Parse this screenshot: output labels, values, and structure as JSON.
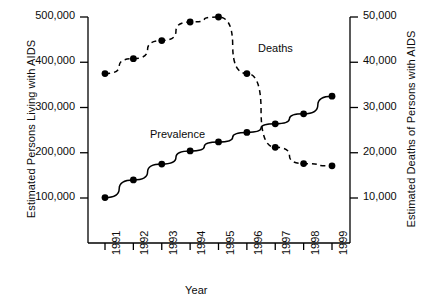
{
  "chart_data": {
    "type": "line",
    "title": "",
    "xlabel": "Year",
    "ylabel_left": "Estimated Persons Living with AIDS",
    "ylabel_right": "Estimated Deaths of Persons with AIDS",
    "categories": [
      "1991",
      "1992",
      "1993",
      "1994",
      "1995",
      "1996",
      "1997",
      "1998",
      "1999"
    ],
    "x": [
      1991,
      1992,
      1993,
      1994,
      1995,
      1996,
      1997,
      1998,
      1999
    ],
    "grid": false,
    "legend_position": "inline-annotation",
    "axes": {
      "left": {
        "label": "Estimated Persons Living with AIDS",
        "ticks": [
          100000,
          200000,
          300000,
          400000,
          500000
        ],
        "tick_labels": [
          "100,000",
          "200,000",
          "300,000",
          "400,000",
          "500,000"
        ],
        "ylim": [
          0,
          520000
        ]
      },
      "right": {
        "label": "Estimated Deaths of Persons with AIDS",
        "ticks": [
          10000,
          20000,
          30000,
          40000,
          50000
        ],
        "tick_labels": [
          "10,000",
          "20,000",
          "30,000",
          "40,000",
          "50,000"
        ],
        "ylim": [
          0,
          52000
        ]
      },
      "x": {
        "label": "Year",
        "ticks": [
          1991,
          1992,
          1993,
          1994,
          1995,
          1996,
          1997,
          1998,
          1999
        ],
        "tick_labels": [
          "1991",
          "1992",
          "1993",
          "1994",
          "1995",
          "1996",
          "1997",
          "1998",
          "1999"
        ],
        "xlim": [
          1990.5,
          1999.5
        ]
      }
    },
    "series": [
      {
        "name": "Prevalence",
        "axis": "left",
        "line_style": "solid",
        "marker": "filled-circle",
        "color": "#000000",
        "values": [
          101000,
          140000,
          175000,
          204000,
          224000,
          245000,
          264000,
          286000,
          325000
        ]
      },
      {
        "name": "Deaths",
        "axis": "right",
        "line_style": "dashed",
        "marker": "filled-circle",
        "color": "#000000",
        "values": [
          37500,
          40800,
          44800,
          48900,
          50000,
          37500,
          21200,
          17600,
          17100
        ]
      }
    ],
    "annotations": [
      {
        "text": "Deaths",
        "x_px": 258,
        "y_px": 42
      },
      {
        "text": "Prevalence",
        "x_px": 150,
        "y_px": 128
      }
    ]
  }
}
